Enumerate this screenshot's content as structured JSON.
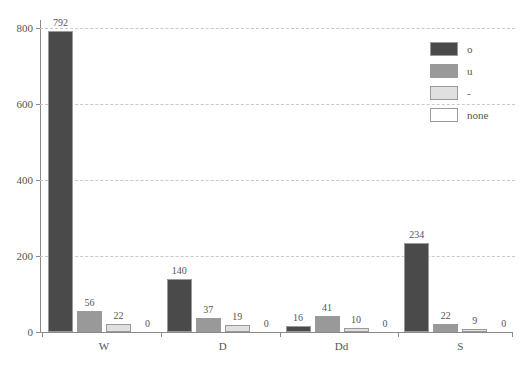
{
  "chart_data": {
    "type": "bar",
    "title": "",
    "subtitle": "",
    "xlabel": "",
    "ylabel": "",
    "categories": [
      "W",
      "D",
      "Dd",
      "S"
    ],
    "series": [
      {
        "name": "o",
        "color": "#4a4a4a",
        "values": [
          792,
          140,
          16,
          234
        ]
      },
      {
        "name": "u",
        "color": "#999999",
        "values": [
          56,
          37,
          41,
          22
        ]
      },
      {
        "name": "-",
        "color": "#e0e0e0",
        "values": [
          22,
          19,
          10,
          9
        ]
      },
      {
        "name": "none",
        "color": "#ffffff",
        "values": [
          0,
          0,
          0,
          0
        ]
      }
    ],
    "ylim": [
      0,
      820
    ],
    "yticks": [
      0,
      200,
      400,
      600,
      800
    ],
    "ytick_labels": [
      "0",
      "200",
      "400",
      "600",
      "800"
    ],
    "grid": true,
    "grid_axis": "y",
    "grid_style": "dashed",
    "legend_position": "top-right",
    "bar_edge_color": "#9a9a9a",
    "axis_color": "#8a8a8a",
    "text_color": "#555555",
    "background_color": "#ffffff",
    "value_labels_shown": true
  },
  "legend": {
    "entries": [
      {
        "label": "o"
      },
      {
        "label": "u"
      },
      {
        "label": "-"
      },
      {
        "label": "none"
      }
    ]
  }
}
